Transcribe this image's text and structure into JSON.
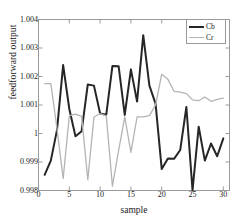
{
  "chart_data": {
    "type": "line",
    "title": "",
    "xlabel": "sample",
    "ylabel": "feedforward output",
    "xlim": [
      0,
      31
    ],
    "ylim": [
      0.998,
      1.004
    ],
    "grid": false,
    "legend_position": "top-right",
    "xticks": [
      0,
      5,
      10,
      15,
      20,
      25,
      30
    ],
    "xtick_labels": [
      "0",
      "5",
      "10",
      "15",
      "20",
      "25",
      "30"
    ],
    "yticks": [
      0.998,
      0.999,
      1.0,
      1.001,
      1.002,
      1.003,
      1.004
    ],
    "ytick_labels": [
      "0.998",
      "0.999",
      "1",
      "1.001",
      "1.002",
      "1.003",
      "1.004"
    ],
    "x": [
      1,
      2,
      3,
      4,
      5,
      6,
      7,
      8,
      9,
      10,
      11,
      12,
      13,
      14,
      15,
      16,
      17,
      18,
      19,
      20,
      21,
      22,
      23,
      24,
      25,
      26,
      27,
      28,
      29,
      30
    ],
    "series": [
      {
        "name": "Cb",
        "color": "#262626",
        "width": 2.0,
        "values": [
          0.99855,
          0.99905,
          1.00012,
          1.0024,
          1.00086,
          0.9999,
          1.00008,
          1.00172,
          1.00168,
          1.0007,
          1.00066,
          1.00237,
          1.00236,
          1.00065,
          1.00225,
          1.00112,
          1.00345,
          1.00168,
          1.00105,
          0.99875,
          0.99912,
          0.99911,
          0.99942,
          1.00093,
          0.998,
          1.00024,
          0.99905,
          0.99965,
          0.9992,
          0.99983
        ]
      },
      {
        "name": "Cr",
        "color": "#b4b4b4",
        "width": 1.3,
        "values": [
          1.00175,
          1.00175,
          1.00018,
          0.99842,
          1.00062,
          1.00068,
          1.0006,
          0.99838,
          1.00058,
          1.0007,
          1.00062,
          0.99815,
          0.9994,
          1.00058,
          0.99934,
          1.00058,
          1.00058,
          1.00063,
          1.001,
          1.00208,
          1.0019,
          1.00148,
          1.00145,
          1.0014,
          1.00118,
          1.00115,
          1.00128,
          1.00113,
          1.0012,
          1.00124
        ]
      }
    ]
  },
  "legend": {
    "items": [
      {
        "label": "Cb"
      },
      {
        "label": "Cr"
      }
    ]
  },
  "colors": {
    "cb": "#262626",
    "cr": "#b4b4b4",
    "axis": "#9a9a9a",
    "text": "#1a1a1a",
    "background": "#ffffff"
  }
}
